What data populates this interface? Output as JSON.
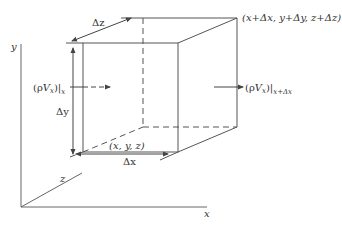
{
  "diagram": {
    "type": "control-volume",
    "colors": {
      "line": "#555555",
      "text": "#333333",
      "background": "#ffffff"
    },
    "axes": {
      "x_label": "x",
      "y_label": "y",
      "z_label": "z"
    },
    "dimensions": {
      "dx_label": "Δx",
      "dy_label": "Δy",
      "dz_label": "Δz"
    },
    "corners": {
      "origin_label": "(x, y, z)",
      "far_label": "(x+Δx, y+Δy, z+Δz)"
    },
    "fluxes": {
      "in": {
        "main": "(ρV",
        "sub_var": "x",
        "close": ")|",
        "eval_at": "x"
      },
      "out": {
        "main": "(ρV",
        "sub_var": "x",
        "close": ")|",
        "eval_at": "x+Δx"
      }
    }
  }
}
